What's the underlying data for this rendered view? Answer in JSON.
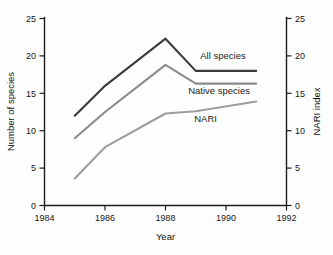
{
  "chart_data": {
    "type": "line",
    "title": "",
    "xlabel": "Year",
    "ylabel": "Number of species",
    "y2label": "NARI index",
    "xlim": [
      1984,
      1992
    ],
    "ylim": [
      0,
      25
    ],
    "y2lim": [
      0,
      25
    ],
    "grid": false,
    "legend_position": "inline-right-of-lines",
    "xticks": [
      1984,
      1986,
      1988,
      1990,
      1992
    ],
    "xtick_labels": [
      "1984",
      "1986",
      "1988",
      "1990",
      "1992"
    ],
    "yticks": [
      0,
      5,
      10,
      15,
      20,
      25
    ],
    "ytick_labels": [
      "0",
      "5",
      "10",
      "15",
      "20",
      "25"
    ],
    "y2ticks": [
      0,
      5,
      10,
      15,
      20,
      25
    ],
    "y2tick_labels": [
      "0",
      "5",
      "10",
      "15",
      "20",
      "25"
    ],
    "x": [
      1985,
      1986,
      1988,
      1989,
      1991
    ],
    "series": [
      {
        "name": "All species",
        "label": "All species",
        "color": "#3b3b3b",
        "axis": "left",
        "values": [
          12.0,
          16.0,
          22.3,
          18.0,
          18.0
        ]
      },
      {
        "name": "Native species",
        "label": "Native species",
        "color": "#8a8a8a",
        "axis": "left",
        "values": [
          9.0,
          12.5,
          18.8,
          16.3,
          16.3
        ]
      },
      {
        "name": "NARI",
        "label": "NARI",
        "color": "#9d9d9d",
        "axis": "right",
        "values": [
          3.6,
          7.8,
          12.3,
          12.6,
          13.9
        ]
      }
    ],
    "annotations": [
      {
        "text": "All species",
        "x": 1989.15,
        "y": 19.6
      },
      {
        "text": "Native species",
        "x": 1988.75,
        "y": 14.9
      },
      {
        "text": "NARI",
        "x": 1988.95,
        "y": 11.2
      }
    ]
  }
}
